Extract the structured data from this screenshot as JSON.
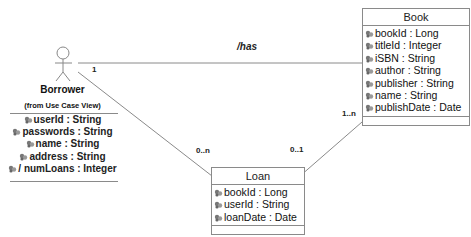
{
  "diagram": {
    "type": "UML class diagram",
    "actor": {
      "name": "Borrower",
      "subtitle": "(from Use Case View)",
      "attributes": [
        "userId : String",
        "passwords : String",
        "name : String",
        "address : String",
        "/ numLoans : Integer"
      ]
    },
    "classes": {
      "book": {
        "name": "Book",
        "attributes": [
          "bookId : Long",
          "titleId : Integer",
          "iSBN : String",
          "author : String",
          "publisher : String",
          "name : String",
          "publishDate : Date"
        ]
      },
      "loan": {
        "name": "Loan",
        "attributes": [
          "bookId : Long",
          "userId : String",
          "loanDate : Date"
        ]
      }
    },
    "associations": [
      {
        "from": "Borrower",
        "to": "Book",
        "name": "/has",
        "from_mult": "1",
        "to_mult": ""
      },
      {
        "from": "Borrower",
        "to": "Loan",
        "name": "",
        "from_mult": "",
        "to_mult": "0..n"
      },
      {
        "from": "Loan",
        "to": "Book",
        "name": "",
        "from_mult": "0..1",
        "to_mult": "1..n"
      }
    ],
    "colors": {
      "line": "#8a8a8a",
      "icon": "#555555"
    }
  }
}
